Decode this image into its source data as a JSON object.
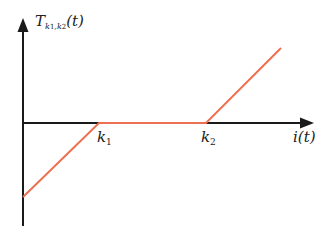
{
  "diagram": {
    "y_axis": {
      "label_main": "T",
      "label_sub_1": "k",
      "label_sub_1_index": "1",
      "label_sub_sep": ",",
      "label_sub_2": "k",
      "label_sub_2_index": "2",
      "label_arg": "(t)"
    },
    "x_axis": {
      "label": "i(t)"
    },
    "breakpoints": [
      {
        "name": "k",
        "index": "1"
      },
      {
        "name": "k",
        "index": "2"
      }
    ],
    "colors": {
      "axis": "#1a1a1a",
      "curve": "#ee7052"
    },
    "segments": [
      {
        "description": "rising from negative value on y-axis to k1 on x-axis"
      },
      {
        "description": "flat at zero between k1 and k2"
      },
      {
        "description": "rising from k2 upward to the right"
      }
    ]
  }
}
